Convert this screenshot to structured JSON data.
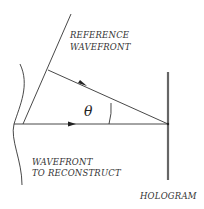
{
  "diagram": {
    "labels": {
      "reference_line1": "REFERENCE",
      "reference_line2": "WAVEFRONT",
      "object_line1": "WAVEFRONT",
      "object_line2": "TO RECONSTRUCT",
      "hologram": "HOLOGRAM",
      "angle": "θ"
    },
    "colors": {
      "ink": "#333333",
      "hologram": "#666666"
    }
  }
}
